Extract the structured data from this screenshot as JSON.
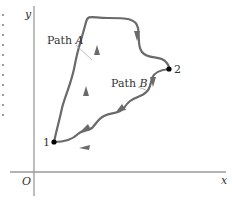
{
  "diagram": {
    "axes": {
      "x_label": "x",
      "y_label": "y",
      "origin_label": "O"
    },
    "points": [
      {
        "label": "1",
        "x": 54,
        "y": 142
      },
      {
        "label": "2",
        "x": 169,
        "y": 69
      }
    ],
    "paths": [
      {
        "name_prefix": "Path ",
        "name_letter": "A",
        "direction": "from 1 to 2",
        "arrows": 3
      },
      {
        "name_prefix": "Path ",
        "name_letter": "B",
        "direction": "from 2 to 1",
        "arrows": 4
      }
    ],
    "colors": {
      "axis": "#9a9a9a",
      "path": "#6a6a6a",
      "point": "#000000",
      "text": "#333333"
    }
  }
}
